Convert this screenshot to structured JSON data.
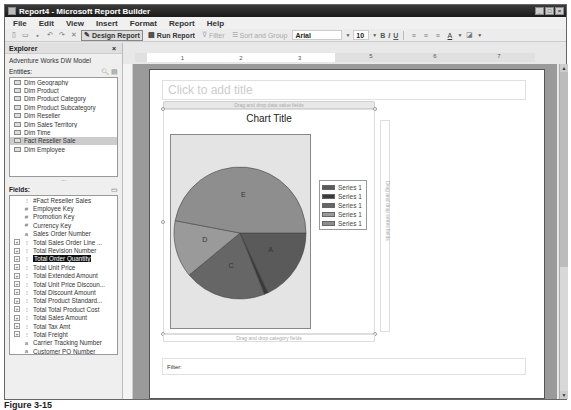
{
  "window": {
    "title": "Report4 - Microsoft Report Builder",
    "buttons": [
      "minimize",
      "maximize",
      "close"
    ]
  },
  "menu": [
    "File",
    "Edit",
    "View",
    "Insert",
    "Format",
    "Report",
    "Help"
  ],
  "toolbar": {
    "design_report": "Design Report",
    "run_report": "Run Report",
    "filter": "Filter",
    "sort_group": "Sort and Group",
    "font": "Arial",
    "size": "10",
    "bold": "B",
    "italic": "I",
    "underline": "U"
  },
  "explorer": {
    "title": "Explorer",
    "close": "×",
    "model": "Adventure Works DW Model",
    "entities_label": "Entities:",
    "entities": [
      "Dim Geography",
      "Dim Product",
      "Dim Product Category",
      "Dim Product Subcategory",
      "Dim Reseller",
      "Dim Sales Territory",
      "Dim Time",
      "Fact Reseller Sale",
      "Dim Employee"
    ],
    "selected_entity": "Fact Reseller Sale",
    "fields_label": "Fields:",
    "fields": [
      {
        "label": "#Fact Reseller Sales",
        "icon": "[]",
        "expand": false
      },
      {
        "label": "Employee Key",
        "icon": "#",
        "expand": false
      },
      {
        "label": "Promotion Key",
        "icon": "#",
        "expand": false
      },
      {
        "label": "Currency Key",
        "icon": "#",
        "expand": false
      },
      {
        "label": "Sales Order Number",
        "icon": "a",
        "expand": false
      },
      {
        "label": "Total Sales Order Line ...",
        "icon": "[]",
        "expand": true
      },
      {
        "label": "Total Revision Number",
        "icon": "[]",
        "expand": true
      },
      {
        "label": "Total Order Quantity",
        "icon": "[]",
        "expand": true,
        "highlighted": true
      },
      {
        "label": "Total Unit Price",
        "icon": "[]",
        "expand": true
      },
      {
        "label": "Total Extended Amount",
        "icon": "[]",
        "expand": true
      },
      {
        "label": "Total Unit Price Discoun...",
        "icon": "[]",
        "expand": true
      },
      {
        "label": "Total Discount Amount",
        "icon": "[]",
        "expand": true
      },
      {
        "label": "Total Product Standard...",
        "icon": "[]",
        "expand": true
      },
      {
        "label": "Total Total Product Cost",
        "icon": "[]",
        "expand": true
      },
      {
        "label": "Total Sales Amount",
        "icon": "[]",
        "expand": true
      },
      {
        "label": "Total Tax Amt",
        "icon": "[]",
        "expand": true
      },
      {
        "label": "Total Freight",
        "icon": "[]",
        "expand": true
      },
      {
        "label": "Carrier Tracking Number",
        "icon": "a",
        "expand": false
      },
      {
        "label": "Customer PO Number",
        "icon": "a",
        "expand": false
      }
    ]
  },
  "ruler": [
    "1",
    "2",
    "3",
    "5",
    "6",
    "7"
  ],
  "report": {
    "title_placeholder": "Click to add title",
    "drop_values": "Drag and drop data value fields",
    "drop_series": "Drag and drop series fields",
    "drop_category": "Drag and drop category fields",
    "filter_label": "Filter:"
  },
  "chart_data": {
    "type": "pie",
    "title": "Chart Title",
    "categories": [
      "A",
      "B",
      "C",
      "D",
      "E"
    ],
    "values": [
      18,
      1,
      20,
      14,
      47
    ],
    "colors": [
      "#5a5a5a",
      "#3a3a3a",
      "#666666",
      "#9a9a9a",
      "#8e8e8e"
    ],
    "legend": [
      "Series 1",
      "Series 1",
      "Series 1",
      "Series 1",
      "Series 1"
    ],
    "legend_position": "right"
  },
  "caption": "Figure 3-15"
}
